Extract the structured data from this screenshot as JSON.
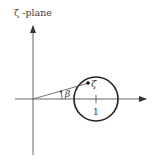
{
  "figure": {
    "title": "ζ -plane",
    "point_label": "ζ",
    "angle_label": "β",
    "unit_label": "1",
    "colors": {
      "ink": "#333333",
      "background": "#ffffff"
    }
  },
  "geometry": {
    "origin": [
      33,
      99
    ],
    "circle_center": [
      96,
      99
    ],
    "circle_radius": 22,
    "point": [
      88,
      83
    ]
  }
}
